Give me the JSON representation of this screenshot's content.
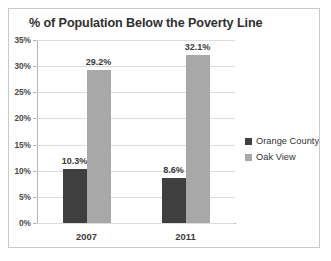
{
  "chart_data": {
    "type": "bar",
    "title": "% of Population Below the Poverty Line",
    "xlabel": "",
    "ylabel": "",
    "categories": [
      "2007",
      "2011"
    ],
    "series": [
      {
        "name": "Orange County",
        "color": "#3f3f3f",
        "values": [
          10.3,
          8.6
        ],
        "value_labels": [
          "10.3%",
          "8.6%"
        ]
      },
      {
        "name": "Oak View",
        "color": "#a8a8a8",
        "values": [
          29.2,
          32.1
        ],
        "value_labels": [
          "29.2%",
          "32.1%"
        ]
      }
    ],
    "ylim": [
      0,
      35
    ],
    "ytick_step": 5,
    "ytick_labels": [
      "35%",
      "30%",
      "25%",
      "20%",
      "15%",
      "10%",
      "5%",
      "0%"
    ],
    "ytick_values": [
      35,
      30,
      25,
      20,
      15,
      10,
      5,
      0
    ],
    "grid": true,
    "legend_position": "right",
    "background_color": "#ffffff",
    "border_color": "#c9c9c9",
    "gridline_color": "#dcdcdc",
    "axis_color": "#b6b6b6",
    "label_color": "#3a3a3a"
  }
}
